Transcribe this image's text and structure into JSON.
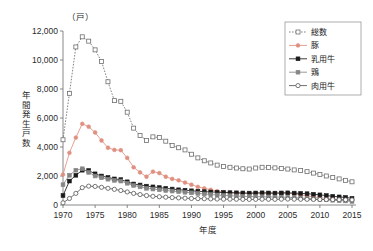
{
  "chart_data": {
    "type": "line",
    "title": "",
    "xlabel": "年度",
    "ylabel": "年間発生戸数",
    "unit_label": "（戸）",
    "xlim": [
      1970,
      2015
    ],
    "ylim": [
      0,
      12000
    ],
    "grid": false,
    "legend_position": "top-right",
    "y_ticks": [
      0,
      2000,
      4000,
      6000,
      8000,
      10000,
      12000
    ],
    "y_tick_labels": [
      "0",
      "2,000",
      "4,000",
      "6,000",
      "8,000",
      "10,000",
      "12,000"
    ],
    "x_ticks": [
      1970,
      1975,
      1980,
      1985,
      1990,
      1995,
      2000,
      2005,
      2010,
      2015
    ],
    "x_tick_labels": [
      "1970",
      "1975",
      "1980",
      "1985",
      "1990",
      "1995",
      "2000",
      "2005",
      "2010",
      "2015"
    ],
    "x": [
      1970,
      1971,
      1972,
      1973,
      1974,
      1975,
      1976,
      1977,
      1978,
      1979,
      1980,
      1981,
      1982,
      1983,
      1984,
      1985,
      1986,
      1987,
      1988,
      1989,
      1990,
      1991,
      1992,
      1993,
      1994,
      1995,
      1996,
      1997,
      1998,
      1999,
      2000,
      2001,
      2002,
      2003,
      2004,
      2005,
      2006,
      2007,
      2008,
      2009,
      2010,
      2011,
      2012,
      2013,
      2014,
      2015
    ],
    "series": [
      {
        "name": "総数",
        "color": "#6e6e6e",
        "marker": "open-square",
        "linestyle": "dotted",
        "values": [
          4500,
          7700,
          10900,
          11600,
          11300,
          10700,
          9900,
          8500,
          7200,
          7150,
          6400,
          5300,
          4800,
          4450,
          4700,
          4650,
          4400,
          4100,
          3950,
          3800,
          3500,
          3250,
          3050,
          2900,
          2750,
          2650,
          2600,
          2550,
          2500,
          2480,
          2550,
          2600,
          2580,
          2560,
          2520,
          2480,
          2420,
          2380,
          2300,
          2200,
          2100,
          2000,
          1900,
          1800,
          1700,
          1600
        ]
      },
      {
        "name": "豚",
        "color": "#e09080",
        "marker": "filled-circle",
        "linestyle": "solid",
        "values": [
          2100,
          3600,
          4650,
          5600,
          5400,
          5000,
          4450,
          3950,
          3800,
          3780,
          3250,
          2600,
          2250,
          1950,
          2300,
          2200,
          1950,
          1800,
          1700,
          1550,
          1400,
          1250,
          1150,
          1050,
          950,
          880,
          850,
          830,
          800,
          790,
          800,
          820,
          810,
          800,
          830,
          820,
          760,
          700,
          620,
          560,
          500,
          450,
          420,
          390,
          350,
          310
        ]
      },
      {
        "name": "乳用牛",
        "color": "#1a1a1a",
        "marker": "filled-square",
        "linestyle": "solid",
        "values": [
          650,
          1650,
          2050,
          2400,
          2380,
          2150,
          2000,
          1900,
          1800,
          1750,
          1600,
          1450,
          1380,
          1300,
          1250,
          1200,
          1150,
          1100,
          1050,
          1020,
          980,
          950,
          920,
          900,
          880,
          860,
          850,
          840,
          830,
          820,
          830,
          840,
          830,
          820,
          830,
          840,
          820,
          800,
          780,
          740,
          700,
          650,
          600,
          560,
          520,
          460
        ]
      },
      {
        "name": "鶏",
        "color": "#858585",
        "marker": "filled-square",
        "linestyle": "solid",
        "values": [
          1400,
          2050,
          2400,
          2500,
          2250,
          2000,
          1880,
          1780,
          1700,
          1650,
          1500,
          1350,
          1250,
          1150,
          1100,
          1050,
          1000,
          960,
          920,
          880,
          840,
          800,
          760,
          720,
          690,
          660,
          640,
          620,
          600,
          590,
          580,
          570,
          560,
          550,
          540,
          530,
          510,
          480,
          450,
          420,
          390,
          360,
          330,
          300,
          280,
          250
        ]
      },
      {
        "name": "肉用牛",
        "color": "#555555",
        "marker": "open-circle",
        "linestyle": "solid",
        "values": [
          150,
          450,
          800,
          1200,
          1300,
          1280,
          1220,
          1150,
          1080,
          1000,
          900,
          800,
          720,
          650,
          600,
          570,
          540,
          510,
          490,
          470,
          450,
          440,
          430,
          420,
          410,
          400,
          400,
          395,
          390,
          385,
          390,
          400,
          395,
          390,
          400,
          410,
          400,
          395,
          390,
          385,
          380,
          375,
          370,
          365,
          360,
          350
        ]
      }
    ]
  },
  "legend": {
    "items": [
      {
        "label": "総数"
      },
      {
        "label": "豚"
      },
      {
        "label": "乳用牛"
      },
      {
        "label": "鶏"
      },
      {
        "label": "肉用牛"
      }
    ]
  }
}
